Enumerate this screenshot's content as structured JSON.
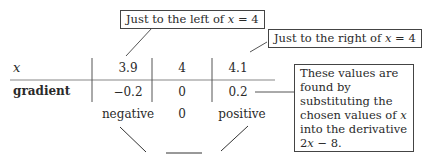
{
  "table": {
    "row_labels": {
      "x": "x",
      "gradient": "gradient"
    },
    "x_values": [
      "3.9",
      "4",
      "4.1"
    ],
    "gradient_values": [
      "−0.2",
      "0",
      "0.2"
    ],
    "signs": [
      "negative",
      "0",
      "positive"
    ]
  },
  "callouts": {
    "left": {
      "prefix": "Just to the left of ",
      "var": "x",
      "suffix": " = 4"
    },
    "right": {
      "prefix": "Just to the right of ",
      "var": "x",
      "suffix": " = 4"
    },
    "note": {
      "part1": "These values are found by substituting the chosen values of ",
      "var": "x",
      "part2": " into the derivative 2",
      "var2": "x",
      "part3": " − 8."
    }
  },
  "shape_sketch": "minimum-point"
}
